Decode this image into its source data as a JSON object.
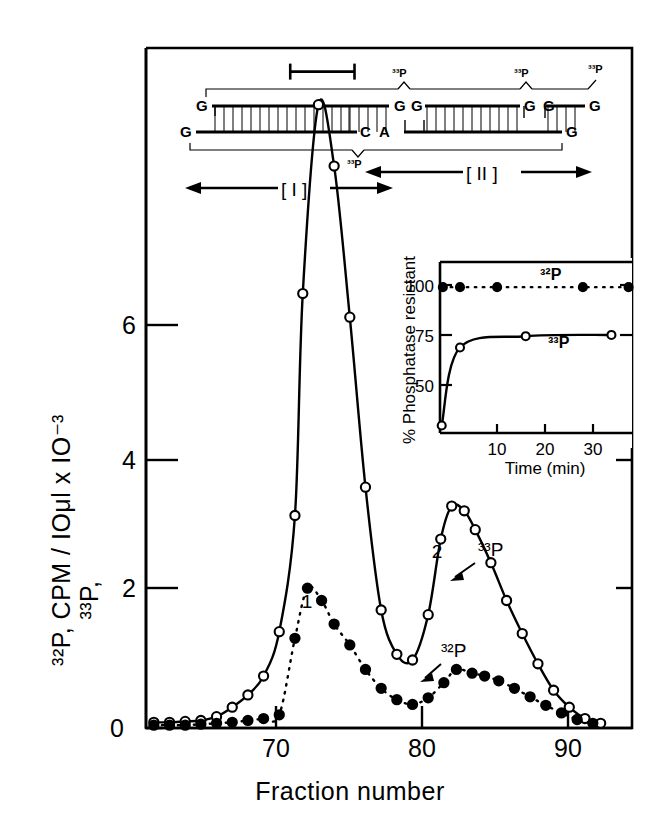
{
  "figure": {
    "axes": {
      "y_label": "³²P, CPM / IOμl x IO⁻³",
      "y_label_line1": "³²P, CPM / IOμl x IO⁻³",
      "y_label_line2": "³³P,",
      "x_label": "Fraction number",
      "y_ticks": [
        "0",
        "2",
        "4",
        "6"
      ],
      "x_ticks": [
        "70",
        "80",
        "90"
      ]
    },
    "annotations": {
      "peak1_label": "1",
      "peak2_label": "2",
      "curve_open_label": "³³P",
      "curve_filled_label": "³²P",
      "region_I": "[ I ]",
      "region_II": "[ II ]"
    },
    "sequence_diagram": {
      "top_strand_letters": [
        "G",
        "G",
        "G",
        "G",
        "G",
        "G"
      ],
      "bottom_strand_letters": [
        "G",
        "C",
        "A",
        "G"
      ],
      "top_bracket_labels": [
        "³³P",
        "³³P",
        "³³P"
      ],
      "bottom_bracket_label": "³³P"
    },
    "inset": {
      "y_label": "% Phosphatase resistant",
      "x_label": "Time  (min)",
      "y_ticks": [
        "50",
        "75",
        "100"
      ],
      "x_ticks": [
        "10",
        "20",
        "30"
      ],
      "series_labels": [
        "³²P",
        "³³P"
      ]
    }
  },
  "chart_data": [
    {
      "type": "line",
      "title": "",
      "xlabel": "Fraction number",
      "ylabel": "³²P, ³³P, CPM / IOμl x IO⁻³",
      "xlim": [
        62,
        93
      ],
      "ylim": [
        0,
        7.2
      ],
      "xticks": [
        70,
        80,
        90
      ],
      "yticks": [
        0,
        2,
        4,
        6
      ],
      "grid": false,
      "legend": "inline-annotations",
      "series": [
        {
          "name": "³³P",
          "marker": "open-circle",
          "linestyle": "solid",
          "x": [
            62.5,
            63.5,
            64.5,
            65.5,
            66.5,
            67.5,
            68.5,
            69.5,
            70.5,
            71.5,
            72.0,
            73.0,
            74.0,
            75.0,
            76.0,
            77.0,
            78.0,
            79.0,
            80.0,
            80.8,
            81.5,
            82.3,
            83.0,
            84.0,
            85.0,
            86.0,
            87.0,
            88.0,
            89.0,
            90.0,
            91.0
          ],
          "y": [
            0.06,
            0.06,
            0.07,
            0.08,
            0.12,
            0.22,
            0.35,
            0.55,
            1.02,
            2.25,
            4.6,
            6.6,
            5.95,
            4.35,
            2.55,
            1.25,
            0.78,
            0.72,
            1.2,
            2.0,
            2.35,
            2.3,
            2.1,
            1.75,
            1.35,
            1.0,
            0.68,
            0.4,
            0.22,
            0.1,
            0.05
          ]
        },
        {
          "name": "³²P",
          "marker": "filled-circle",
          "linestyle": "dashed",
          "x": [
            62.5,
            63.5,
            64.5,
            65.5,
            66.5,
            67.5,
            68.5,
            69.5,
            70.5,
            71.5,
            72.3,
            73.2,
            74.0,
            75.0,
            76.0,
            77.0,
            78.0,
            79.0,
            80.0,
            81.0,
            81.8,
            82.8,
            83.6,
            84.5,
            85.5,
            86.5,
            87.5,
            88.5,
            89.5,
            90.5
          ],
          "y": [
            0.03,
            0.03,
            0.03,
            0.04,
            0.05,
            0.06,
            0.08,
            0.1,
            0.14,
            0.95,
            1.48,
            1.35,
            1.1,
            0.88,
            0.62,
            0.42,
            0.3,
            0.25,
            0.32,
            0.48,
            0.62,
            0.58,
            0.55,
            0.5,
            0.42,
            0.33,
            0.24,
            0.16,
            0.09,
            0.05
          ]
        }
      ],
      "marker_bar": {
        "label": "",
        "x_start": 71.2,
        "x_end": 75.3,
        "y": 6.95
      }
    },
    {
      "type": "line",
      "title": "",
      "xlabel": "Time  (min)",
      "ylabel": "% Phosphatase resistant",
      "xlim": [
        0,
        35
      ],
      "ylim": [
        40,
        108
      ],
      "xticks": [
        10,
        20,
        30
      ],
      "yticks": [
        50,
        75,
        100
      ],
      "grid": false,
      "legend": "inline-annotations",
      "series": [
        {
          "name": "³²P",
          "marker": "filled-circle",
          "linestyle": "dashed",
          "x": [
            0.5,
            3.5,
            10.0,
            25.0,
            33.0
          ],
          "y": [
            98,
            98,
            98,
            98,
            98
          ]
        },
        {
          "name": "³³P",
          "marker": "open-circle",
          "linestyle": "solid",
          "x": [
            0.3,
            3.5,
            15.0,
            30.0
          ],
          "y": [
            43,
            74,
            78.5,
            79
          ]
        }
      ]
    }
  ]
}
